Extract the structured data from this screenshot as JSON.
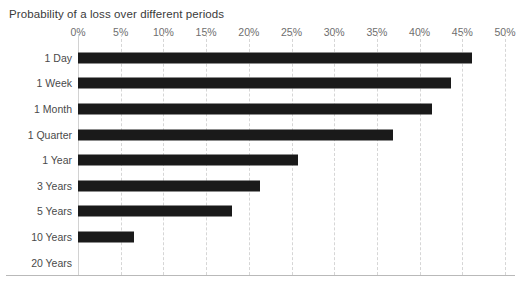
{
  "chart_data": {
    "type": "bar",
    "orientation": "horizontal",
    "title": "Probability of a loss over different periods",
    "xlabel": "",
    "ylabel": "",
    "categories": [
      "1 Day",
      "1 Week",
      "1 Month",
      "1 Quarter",
      "1 Year",
      "3 Years",
      "5 Years",
      "10 Years",
      "20 Years"
    ],
    "values": [
      46.1,
      43.7,
      41.5,
      36.9,
      25.8,
      21.3,
      18.0,
      6.5,
      0
    ],
    "value_unit": "%",
    "xlim": [
      0,
      50
    ],
    "xticks": [
      0,
      5,
      10,
      15,
      20,
      25,
      30,
      35,
      40,
      45,
      50
    ],
    "xtick_labels": [
      "0%",
      "5%",
      "10%",
      "15%",
      "20%",
      "25%",
      "30%",
      "35%",
      "40%",
      "45%",
      "50%"
    ],
    "grid": "vertical-dashed",
    "legend": "none",
    "series": [
      {
        "name": "Probability of a loss",
        "values": [
          46.1,
          43.7,
          41.5,
          36.9,
          25.8,
          21.3,
          18.0,
          6.5,
          0
        ]
      }
    ],
    "colors": {
      "bar": "#1a1a1a",
      "gridline": "#d6d6d6",
      "axis": "#d2d2d2",
      "rule": "#b9b9b9",
      "title_text": "#3a3a3a",
      "tick_text": "#6e6e6e",
      "category_text": "#4a4a4a",
      "background": "#ffffff"
    }
  }
}
